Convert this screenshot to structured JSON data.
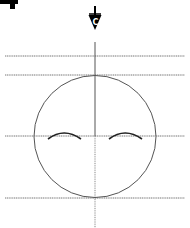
{
  "diagram": {
    "type": "face-symmetry-guide",
    "centerline_marker": {
      "symbol": "C",
      "label": "centerline"
    },
    "corner_glyph": "partial step marker",
    "guide_lines": [
      {
        "name": "guide-line-top",
        "y": 56
      },
      {
        "name": "guide-line-head-top",
        "y": 75
      },
      {
        "name": "guide-line-brow",
        "y": 136
      },
      {
        "name": "guide-line-chin",
        "y": 198
      }
    ],
    "circle": {
      "cx": 95,
      "cy": 136,
      "r": 61
    },
    "eyebrows": [
      {
        "name": "left-eyebrow",
        "x1": 48,
        "x2": 81
      },
      {
        "name": "right-eyebrow",
        "x1": 109,
        "x2": 142
      }
    ],
    "colors": {
      "stroke": "#444444",
      "guide": "#777777",
      "ink": "#000000",
      "background": "#ffffff"
    }
  }
}
